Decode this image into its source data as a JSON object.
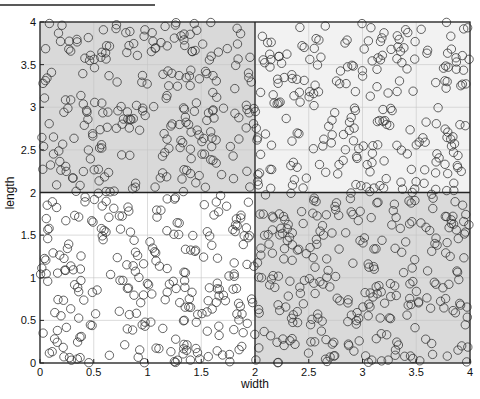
{
  "chart_data": {
    "type": "scatter",
    "title": "",
    "xlabel": "width",
    "ylabel": "length",
    "xlim": [
      0,
      4
    ],
    "ylim": [
      0,
      4
    ],
    "xticks": [
      "0",
      "0.5",
      "1",
      "1.5",
      "2",
      "2.5",
      "3",
      "3.5",
      "4"
    ],
    "yticks": [
      "0",
      "0.5",
      "1",
      "1.5",
      "2",
      "2.5",
      "3",
      "3.5",
      "4"
    ],
    "grid": true,
    "legend": null,
    "marker": "open-circle",
    "marker_color": "#333333",
    "dividers": {
      "x": 2,
      "y": 2
    },
    "regions": [
      {
        "name": "top-left",
        "x": [
          0,
          2
        ],
        "y": [
          2,
          4
        ],
        "fill": "#d9d9d9",
        "approx_points": 240
      },
      {
        "name": "top-right",
        "x": [
          2,
          4
        ],
        "y": [
          2,
          4
        ],
        "fill": "#f2f2f2",
        "approx_points": 230
      },
      {
        "name": "bottom-left",
        "x": [
          0,
          2
        ],
        "y": [
          0,
          2
        ],
        "fill": "#ffffff",
        "approx_points": 240
      },
      {
        "name": "bottom-right",
        "x": [
          2,
          4
        ],
        "y": [
          0,
          2
        ],
        "fill": "#dadada",
        "approx_points": 270
      }
    ],
    "point_distribution": "uniform random within each region"
  },
  "header_rule": {
    "visible": true
  }
}
